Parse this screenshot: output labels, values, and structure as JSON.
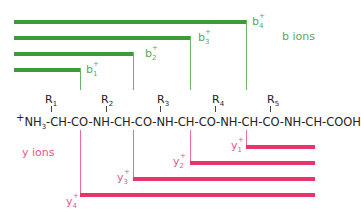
{
  "colors": {
    "b_ions": "#3d9a3a",
    "y_ions": "#e8336d"
  },
  "b_ions": {
    "label": "b ions",
    "ions": [
      {
        "name": "b",
        "index": "1",
        "charge": "+"
      },
      {
        "name": "b",
        "index": "2",
        "charge": "+"
      },
      {
        "name": "b",
        "index": "3",
        "charge": "+"
      },
      {
        "name": "b",
        "index": "4",
        "charge": "+"
      }
    ]
  },
  "y_ions": {
    "label": "y ions",
    "ions": [
      {
        "name": "y",
        "index": "1",
        "charge": "+"
      },
      {
        "name": "y",
        "index": "2",
        "charge": "+"
      },
      {
        "name": "y",
        "index": "3",
        "charge": "+"
      },
      {
        "name": "y",
        "index": "4",
        "charge": "+"
      }
    ]
  },
  "peptide": {
    "n_term_charge": "+",
    "segments": [
      "NH",
      "3",
      "-CH-CO-NH-CH-CO-NH-CH-CO-NH-CH-CO-NH-CH-COOH"
    ],
    "side_chains": [
      {
        "r": "R",
        "i": "1"
      },
      {
        "r": "R",
        "i": "2"
      },
      {
        "r": "R",
        "i": "3"
      },
      {
        "r": "R",
        "i": "4"
      },
      {
        "r": "R",
        "i": "5"
      }
    ]
  }
}
